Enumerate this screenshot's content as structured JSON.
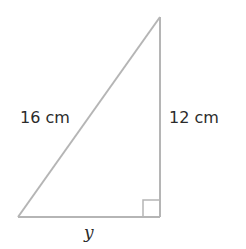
{
  "diagram": {
    "type": "right-triangle",
    "hypotenuse_label": "16 cm",
    "vertical_leg_label": "12 cm",
    "horizontal_leg_label": "y",
    "right_angle_marker": true,
    "colors": {
      "stroke": "#b5b5b5",
      "text": "#2b2b2b",
      "background": "#ffffff"
    }
  }
}
